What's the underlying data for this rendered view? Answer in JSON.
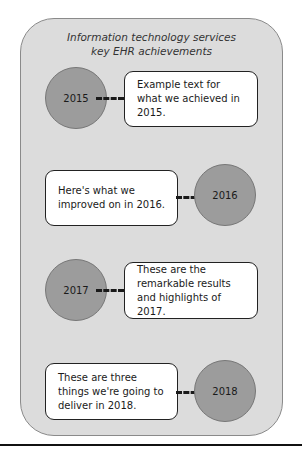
{
  "diagram": {
    "title_line1": "Information technology services",
    "title_line2": "key EHR achievements",
    "milestones": [
      {
        "year": "2015",
        "text": "Example text for what we achieved in 2015.",
        "side": "circle-left"
      },
      {
        "year": "2016",
        "text": "Here's what we improved on in 2016.",
        "side": "circle-right"
      },
      {
        "year": "2017",
        "text": "These are the remarkable results and highlights of 2017.",
        "side": "circle-left"
      },
      {
        "year": "2018",
        "text": "These are three things we're going to deliver in 2018.",
        "side": "circle-right"
      }
    ],
    "colors": {
      "panel_bg": "#dcdcdc",
      "circle_fill": "#9c9c9c",
      "box_fill": "#ffffff",
      "connector": "#1a1a1a"
    }
  }
}
